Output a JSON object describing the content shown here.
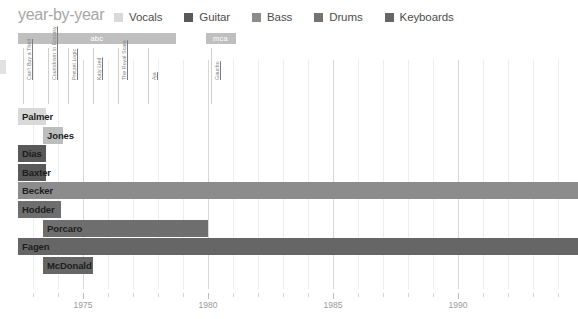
{
  "header": {
    "title": "year-by-year",
    "legend": [
      {
        "label": "Vocals",
        "color": "#d9d9d9",
        "icon": "square-swatch-icon"
      },
      {
        "label": "Guitar",
        "color": "#595959",
        "icon": "square-swatch-icon"
      },
      {
        "label": "Bass",
        "color": "#8c8c8c",
        "icon": "square-swatch-icon"
      },
      {
        "label": "Drums",
        "color": "#737373",
        "icon": "square-swatch-icon"
      },
      {
        "label": "Keyboards",
        "color": "#666666",
        "icon": "square-swatch-icon"
      }
    ]
  },
  "labels": {
    "x_axis_ticks": [
      "1975",
      "1980",
      "1985",
      "1990"
    ]
  },
  "chart_data": {
    "type": "bar",
    "title": "year-by-year",
    "xlabel": "",
    "ylabel": "",
    "xlim": [
      1972.4,
      1994.8
    ],
    "grid": true,
    "legend_position": "top",
    "x_ticks": [
      1975,
      1980,
      1985,
      1990
    ],
    "x_tick_labels": [
      "1975",
      "1980",
      "1985",
      "1990"
    ],
    "label_bars": [
      {
        "name": "abc",
        "start": 1972.4,
        "end": 1978.7,
        "color": "#bfbfbf"
      },
      {
        "name": "mca",
        "start": 1979.9,
        "end": 1981.1,
        "color": "#bfbfbf"
      }
    ],
    "albums": [
      {
        "name": "Can't Buy a Thrill",
        "year": 1972.6
      },
      {
        "name": "Countdown to Ecstasy",
        "year": 1973.6
      },
      {
        "name": "Pretzel Logic",
        "year": 1974.4
      },
      {
        "name": "Katy Lied",
        "year": 1975.4
      },
      {
        "name": "The Royal Scam",
        "year": 1976.4
      },
      {
        "name": "Aja",
        "year": 1977.6
      },
      {
        "name": "Gaucho",
        "year": 1980.1
      }
    ],
    "categories": [
      "Palmer",
      "Jones",
      "Dias",
      "Baxter",
      "Becker",
      "Hodder",
      "Porcaro",
      "Fagen",
      "McDonald"
    ],
    "series": [
      {
        "name": "Palmer",
        "role": "Vocals",
        "start": 1972.4,
        "end": 1973.5,
        "color": "#d9d9d9",
        "label_side": "left"
      },
      {
        "name": "Jones",
        "role": "Bass",
        "start": 1973.4,
        "end": 1974.2,
        "color": "#bdbdbd",
        "label_side": "right"
      },
      {
        "name": "Dias",
        "role": "Guitar",
        "start": 1972.4,
        "end": 1973.5,
        "color": "#595959",
        "label_side": "left"
      },
      {
        "name": "Baxter",
        "role": "Guitar",
        "start": 1972.4,
        "end": 1973.5,
        "color": "#595959",
        "label_side": "left"
      },
      {
        "name": "Becker",
        "role": "Bass",
        "start": 1972.4,
        "end": 1994.8,
        "color": "#8c8c8c",
        "label_side": "left"
      },
      {
        "name": "Hodder",
        "role": "Drums",
        "start": 1972.4,
        "end": 1974.1,
        "color": "#6e6e6e",
        "label_side": "left"
      },
      {
        "name": "Porcaro",
        "role": "Drums",
        "start": 1973.4,
        "end": 1980.0,
        "color": "#6e6e6e",
        "label_side": "right"
      },
      {
        "name": "Fagen",
        "role": "Keyboards",
        "start": 1972.4,
        "end": 1994.8,
        "color": "#666666",
        "label_side": "left"
      },
      {
        "name": "McDonald",
        "role": "Keyboards",
        "start": 1973.4,
        "end": 1975.4,
        "color": "#666666",
        "label_side": "right"
      }
    ]
  }
}
